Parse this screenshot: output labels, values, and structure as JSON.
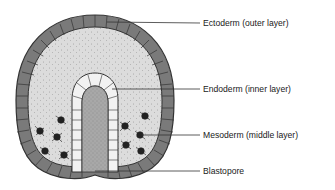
{
  "diagram": {
    "labels": [
      {
        "text": "Ectoderm (outer layer)",
        "y": 19
      },
      {
        "text": "Endoderm (inner layer)",
        "y": 85
      },
      {
        "text": "Mesoderm (middle layer)",
        "y": 131
      },
      {
        "text": "Blastopore",
        "y": 167
      }
    ],
    "colors": {
      "ectoderm": "#7a7a7a",
      "cavity": "#dcdcdc",
      "endoderm": "#f2f2f2",
      "archenteron": "#a8a8a8",
      "mesoderm": "#222222",
      "outline": "#333333"
    }
  }
}
